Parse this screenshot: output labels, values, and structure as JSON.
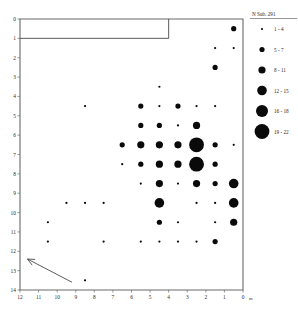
{
  "chart_data": {
    "type": "scatter",
    "title": "",
    "subtitle": "",
    "xlabel": "",
    "ylabel": "",
    "x_unit": "0 m",
    "xlim": [
      12,
      0
    ],
    "ylim": [
      0,
      14
    ],
    "x_axis_direction": "decreasing-left-to-right",
    "xticks": [
      12,
      11,
      10,
      9,
      8,
      7,
      6,
      5,
      4,
      3,
      2,
      1,
      0
    ],
    "yticks": [
      0,
      1,
      2,
      3,
      4,
      5,
      6,
      7,
      8,
      9,
      10,
      11,
      12,
      13,
      14
    ],
    "grid": false,
    "legend_position": "right",
    "legend": {
      "title": "N Sub. 291",
      "entries": [
        {
          "label": "1 - 4",
          "radius": 1.1,
          "value_min": 1,
          "value_max": 4
        },
        {
          "label": "5 - 7",
          "radius": 2.6,
          "value_min": 5,
          "value_max": 7
        },
        {
          "label": "8 - 11",
          "radius": 3.6,
          "value_min": 8,
          "value_max": 11
        },
        {
          "label": "12 - 15",
          "radius": 4.8,
          "value_min": 12,
          "value_max": 15
        },
        {
          "label": "16 - 18",
          "radius": 6.0,
          "value_min": 16,
          "value_max": 18
        },
        {
          "label": "19 - 22",
          "radius": 7.4,
          "value_min": 19,
          "value_max": 22
        }
      ]
    },
    "annotations": [
      {
        "name": "trend-arrow",
        "type": "arrow",
        "x_from": 9.2,
        "y_from": 13.6,
        "x_to": 11.6,
        "y_to": 12.4
      },
      {
        "name": "boundary-notch",
        "type": "step-line",
        "description": "stepped outline in upper-left of plot frame from x=12,y=1 to x=4,y=1 then up to x=4,y=0"
      }
    ],
    "points": [
      {
        "x": 0.5,
        "y": 0.5,
        "v": 6
      },
      {
        "x": 1.5,
        "y": 1.5,
        "v": 3
      },
      {
        "x": 0.5,
        "y": 1.5,
        "v": 3
      },
      {
        "x": 1.5,
        "y": 2.5,
        "v": 5
      },
      {
        "x": 4.5,
        "y": 3.5,
        "v": 2
      },
      {
        "x": 8.5,
        "y": 4.5,
        "v": 2
      },
      {
        "x": 5.5,
        "y": 4.5,
        "v": 6
      },
      {
        "x": 4.5,
        "y": 4.5,
        "v": 3
      },
      {
        "x": 3.5,
        "y": 4.5,
        "v": 6
      },
      {
        "x": 2.5,
        "y": 4.5,
        "v": 3
      },
      {
        "x": 1.5,
        "y": 4.5,
        "v": 3
      },
      {
        "x": 5.5,
        "y": 5.5,
        "v": 5
      },
      {
        "x": 4.5,
        "y": 5.5,
        "v": 5
      },
      {
        "x": 3.5,
        "y": 5.5,
        "v": 2
      },
      {
        "x": 2.5,
        "y": 5.5,
        "v": 9
      },
      {
        "x": 6.5,
        "y": 6.5,
        "v": 5
      },
      {
        "x": 5.5,
        "y": 6.5,
        "v": 11
      },
      {
        "x": 4.5,
        "y": 6.5,
        "v": 9
      },
      {
        "x": 3.5,
        "y": 6.5,
        "v": 10
      },
      {
        "x": 2.5,
        "y": 6.5,
        "v": 21
      },
      {
        "x": 1.5,
        "y": 6.5,
        "v": 7
      },
      {
        "x": 0.5,
        "y": 6.5,
        "v": 2
      },
      {
        "x": 6.5,
        "y": 7.5,
        "v": 4
      },
      {
        "x": 5.5,
        "y": 7.5,
        "v": 5
      },
      {
        "x": 4.5,
        "y": 7.5,
        "v": 10
      },
      {
        "x": 3.5,
        "y": 7.5,
        "v": 9
      },
      {
        "x": 2.5,
        "y": 7.5,
        "v": 19
      },
      {
        "x": 1.5,
        "y": 7.5,
        "v": 6
      },
      {
        "x": 5.5,
        "y": 8.5,
        "v": 3
      },
      {
        "x": 4.5,
        "y": 8.5,
        "v": 8
      },
      {
        "x": 3.5,
        "y": 8.5,
        "v": 3
      },
      {
        "x": 2.5,
        "y": 8.5,
        "v": 11
      },
      {
        "x": 1.5,
        "y": 8.5,
        "v": 5
      },
      {
        "x": 0.5,
        "y": 8.5,
        "v": 13
      },
      {
        "x": 9.5,
        "y": 9.5,
        "v": 2
      },
      {
        "x": 8.5,
        "y": 9.5,
        "v": 2
      },
      {
        "x": 7.5,
        "y": 9.5,
        "v": 2
      },
      {
        "x": 4.5,
        "y": 9.5,
        "v": 12
      },
      {
        "x": 2.5,
        "y": 9.5,
        "v": 3
      },
      {
        "x": 1.5,
        "y": 9.5,
        "v": 3
      },
      {
        "x": 0.5,
        "y": 9.5,
        "v": 12
      },
      {
        "x": 10.5,
        "y": 10.5,
        "v": 2
      },
      {
        "x": 4.5,
        "y": 10.5,
        "v": 7
      },
      {
        "x": 3.5,
        "y": 10.5,
        "v": 2
      },
      {
        "x": 1.5,
        "y": 10.5,
        "v": 3
      },
      {
        "x": 0.5,
        "y": 10.5,
        "v": 9
      },
      {
        "x": 10.5,
        "y": 11.5,
        "v": 2
      },
      {
        "x": 7.5,
        "y": 11.5,
        "v": 2
      },
      {
        "x": 5.5,
        "y": 11.5,
        "v": 2
      },
      {
        "x": 4.5,
        "y": 11.5,
        "v": 2
      },
      {
        "x": 3.5,
        "y": 11.5,
        "v": 2
      },
      {
        "x": 2.5,
        "y": 11.5,
        "v": 2
      },
      {
        "x": 1.5,
        "y": 11.5,
        "v": 5
      },
      {
        "x": 8.5,
        "y": 13.5,
        "v": 2
      }
    ]
  }
}
